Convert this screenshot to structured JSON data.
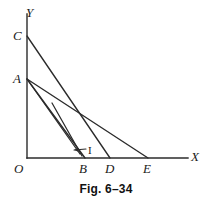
{
  "figure": {
    "caption": "Fig. 6–34",
    "background_color": "#ffffff",
    "stroke_color": "#2b2b2b",
    "label_color": "#1a1a1a"
  },
  "axes": {
    "x_label": "X",
    "y_label": "Y",
    "origin_label": "O",
    "origin_px": {
      "x": 27,
      "y": 158
    },
    "x_axis_end_px": {
      "x": 188,
      "y": 158
    },
    "y_axis_top_px": {
      "x": 27,
      "y": 14
    }
  },
  "points": [
    {
      "name": "Y",
      "label": "Y",
      "x": 27,
      "y": 14,
      "label_x": 26,
      "label_y": 6,
      "on_axis": "y-axis-tip"
    },
    {
      "name": "C",
      "label": "C",
      "x": 27,
      "y": 36,
      "label_x": 13,
      "label_y": 29,
      "on_axis": "y"
    },
    {
      "name": "A",
      "label": "A",
      "x": 27,
      "y": 79,
      "label_x": 13,
      "label_y": 72,
      "on_axis": "y"
    },
    {
      "name": "O",
      "label": "O",
      "x": 27,
      "y": 158,
      "label_x": 14,
      "label_y": 162,
      "on_axis": "origin"
    },
    {
      "name": "B",
      "label": "B",
      "x": 83,
      "y": 158,
      "label_x": 79,
      "label_y": 162,
      "on_axis": "x"
    },
    {
      "name": "D",
      "label": "D",
      "x": 110,
      "y": 158,
      "label_x": 105,
      "label_y": 162,
      "on_axis": "x"
    },
    {
      "name": "E",
      "label": "E",
      "x": 148,
      "y": 158,
      "label_x": 143,
      "label_y": 162,
      "on_axis": "x"
    },
    {
      "name": "X",
      "label": "X",
      "x": 188,
      "y": 158,
      "label_x": 191,
      "label_y": 150,
      "on_axis": "x-axis-tip"
    }
  ],
  "segments": [
    {
      "name": "segment-C-D",
      "from": "C",
      "to": "D",
      "x1": 27,
      "y1": 36,
      "x2": 110,
      "y2": 158
    },
    {
      "name": "segment-A-E",
      "from": "A",
      "to": "E",
      "x1": 27,
      "y1": 79,
      "x2": 148,
      "y2": 158
    },
    {
      "name": "segment-A-B-outer",
      "from": "A",
      "to": "B",
      "x1": 27,
      "y1": 79,
      "x2": 85,
      "y2": 158
    },
    {
      "name": "segment-A-B-inner",
      "from": "A",
      "to": "B",
      "x1": 27,
      "y1": 79,
      "x2": 80,
      "y2": 154
    },
    {
      "name": "segment-isocost-I",
      "from": "interior",
      "to": "B",
      "x1": 52,
      "y1": 103,
      "x2": 82,
      "y2": 156
    }
  ],
  "annotation": {
    "label": "I",
    "label_x": 88,
    "label_y": 145,
    "pointer_from": {
      "x": 86,
      "y": 149
    },
    "pointer_to": {
      "x": 74,
      "y": 150
    }
  }
}
